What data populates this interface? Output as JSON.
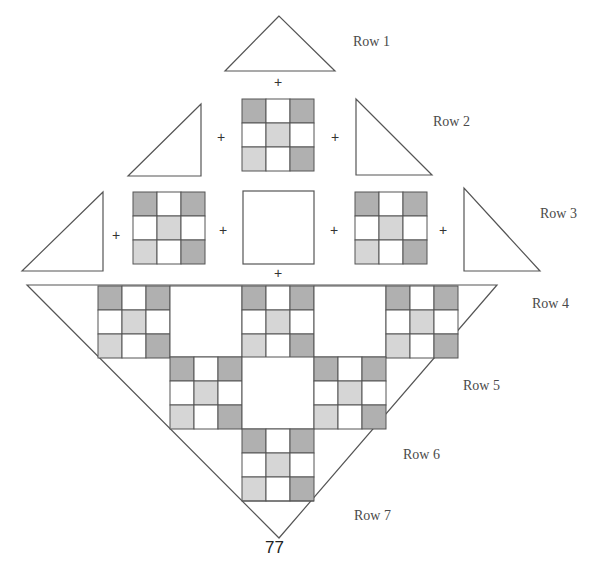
{
  "colors": {
    "line": "#555555",
    "dark": "#b0b0b0",
    "light": "#d6d6d6",
    "white": "#ffffff"
  },
  "row_labels": [
    "Row 1",
    "Row 2",
    "Row 3",
    "Row 4",
    "Row 5",
    "Row 6",
    "Row 7"
  ],
  "plus_sign": "+",
  "page_number": "77",
  "nine_patch_pattern": [
    [
      "dark",
      "white",
      "dark"
    ],
    [
      "white",
      "light",
      "white"
    ],
    [
      "light",
      "white",
      "dark"
    ]
  ],
  "assembly": {
    "row1": [
      "setting-triangle"
    ],
    "row2": [
      "corner-triangle",
      "nine-patch",
      "corner-triangle"
    ],
    "row3": [
      "corner-triangle",
      "nine-patch",
      "plain-square",
      "nine-patch",
      "corner-triangle"
    ],
    "assembled_rows": [
      "Row 4",
      "Row 5",
      "Row 6",
      "Row 7"
    ]
  }
}
